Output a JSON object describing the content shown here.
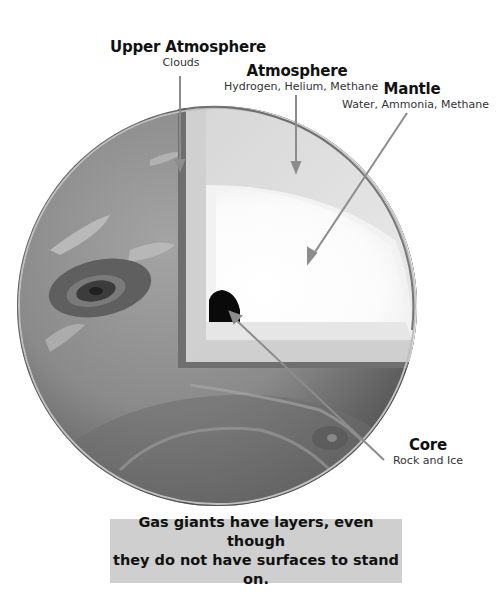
{
  "diagram": {
    "labels": [
      {
        "id": "upper-atmosphere",
        "title": "Upper Atmosphere",
        "sub": "Clouds"
      },
      {
        "id": "atmosphere",
        "title": "Atmosphere",
        "sub": "Hydrogen, Helium, Methane"
      },
      {
        "id": "mantle",
        "title": "Mantle",
        "sub": "Water, Ammonia, Methane"
      },
      {
        "id": "core",
        "title": "Core",
        "sub": "Rock and Ice"
      }
    ],
    "colors": {
      "planet_surface": "#8a8a8a",
      "planet_shadow": "#5a5a5a",
      "atmosphere_layer": "#e3e3e3",
      "mantle_layer": "#f4f4f4",
      "inner_mantle": "#ffffff",
      "core": "#0a0a0a",
      "pointer_line": "#8c8c8c",
      "caption_bg": "#cfcfcf"
    }
  },
  "caption": {
    "text": "Gas giants have layers, even though\nthey do not have surfaces to stand on."
  }
}
